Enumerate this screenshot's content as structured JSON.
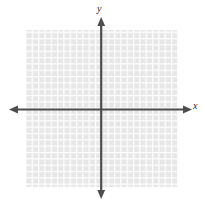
{
  "figure": {
    "title": "",
    "width": 205,
    "height": 209,
    "background_color": "#ffffff"
  },
  "axes": {
    "x_label": "x",
    "y_label": "y",
    "axis_color": "#4d4d4d",
    "origin": {
      "x": 101,
      "y": 109
    },
    "x_axis": {
      "start_x": 10,
      "end_x": 190,
      "y": 109,
      "arrow_start": true,
      "arrow_end": true
    },
    "y_axis": {
      "start_y": 18,
      "end_y": 198,
      "x": 101,
      "arrow_start": true,
      "arrow_end": true
    }
  },
  "grid": {
    "left": 26,
    "top": 30,
    "right": 178,
    "bottom": 187,
    "cell_size": 6.33,
    "columns": 24,
    "rows": 25,
    "cell_color": "#e7e7e7",
    "line_color": "#ffffff",
    "line_width": 1.2
  },
  "chart_data": {
    "type": "scatter",
    "title": "",
    "xlabel": "x",
    "ylabel": "y",
    "x": [],
    "y": [],
    "series": [],
    "xlim": [
      -12,
      12
    ],
    "ylim": [
      -13,
      12
    ],
    "xticks": [],
    "yticks": [],
    "xticklabels": [],
    "yticklabels": [],
    "grid": true,
    "legend": false,
    "legend_position": "none",
    "annotations": []
  }
}
